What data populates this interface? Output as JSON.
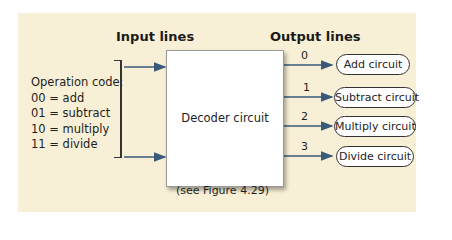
{
  "headers": {
    "input": "Input lines",
    "output": "Output lines"
  },
  "opcode": {
    "title": "Operation code:",
    "items": [
      "00 = add",
      "01 = subtract",
      "10 = multiply",
      "11 = divide"
    ]
  },
  "decoder": {
    "label": "Decoder circuit"
  },
  "outputs": [
    {
      "line": "0",
      "label": "Add circuit"
    },
    {
      "line": "1",
      "label": "Subtract circuit"
    },
    {
      "line": "2",
      "label": "Multiply circuit"
    },
    {
      "line": "3",
      "label": "Divide circuit"
    }
  ],
  "caption": "(see Figure 4.29)",
  "colors": {
    "background": "#f8f0d6",
    "arrow": "#3a5a7a"
  }
}
